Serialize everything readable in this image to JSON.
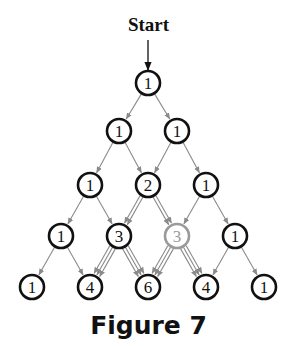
{
  "start_label": "Start",
  "caption": "Figure 7",
  "colors": {
    "node": "#111111",
    "highlight": "#9a9a9a",
    "edge": "#8a8a8a"
  },
  "rows": [
    [
      1
    ],
    [
      1,
      1
    ],
    [
      1,
      2,
      1
    ],
    [
      1,
      3,
      3,
      1
    ],
    [
      1,
      4,
      6,
      4,
      1
    ]
  ],
  "highlighted": {
    "row": 3,
    "index": 2
  }
}
